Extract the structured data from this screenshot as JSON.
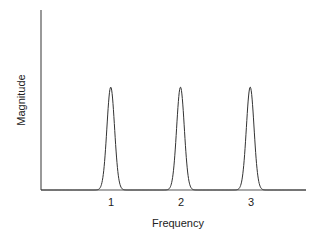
{
  "chart_data": {
    "type": "line",
    "title": "",
    "xlabel": "Frequency",
    "ylabel": "Magnitude",
    "x_ticks": [
      "1",
      "2",
      "3"
    ],
    "series": [
      {
        "name": "spectrum",
        "description": "Three identical narrow Gaussian-like peaks of equal magnitude at frequencies 1, 2 and 3; zero elsewhere",
        "peaks": [
          {
            "x": 1,
            "magnitude": 1.0
          },
          {
            "x": 2,
            "magnitude": 1.0
          },
          {
            "x": 3,
            "magnitude": 1.0
          }
        ]
      }
    ],
    "xlim": [
      0,
      3.8
    ],
    "ylim": [
      0,
      1.75
    ],
    "grid": false,
    "legend": null,
    "colors": {
      "line": "#333333",
      "axis": "#555555"
    }
  }
}
